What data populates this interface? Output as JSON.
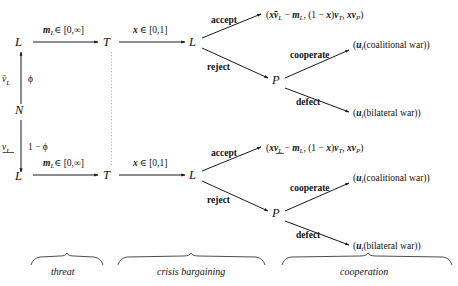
{
  "figure": {
    "background_color": "#ffffff",
    "line_color": "#1a1a1a",
    "infoset_color": "#9a9a9a"
  },
  "nodes": {
    "nature": "N",
    "top_leader": "L",
    "top_target": "T",
    "top_leader2": "L",
    "top_patron": "P",
    "bottom_leader": "L",
    "bottom_target": "T",
    "bottom_leader2": "L",
    "bottom_patron": "P"
  },
  "nature_branches": {
    "top_type": "v̄",
    "top_type_sub": "L",
    "top_prob": "ϕ",
    "bottom_type": "v",
    "bottom_type_sub": "L",
    "bottom_prob": "1 − ϕ"
  },
  "edges": {
    "threat_action": "m",
    "threat_action_sub": "L",
    "threat_action_set": "∈ [0,∞]",
    "offer_action": "x",
    "offer_action_set": "∈ [0,1]",
    "accept": "accept",
    "reject": "reject",
    "cooperate": "cooperate",
    "defect": "defect"
  },
  "payoffs": {
    "top_accept": "(xv̄L − mL, (1 − x)vT, xvP)",
    "top_coalitional": "(ui(coalitional war))",
    "top_bilateral": "(ui(bilateral war))",
    "bottom_accept": "(xvL − mL, (1 − x)vT, xvP)",
    "bottom_coalitional": "(ui(coalitional war))",
    "bottom_bilateral": "(ui(bilateral war))"
  },
  "phases": [
    {
      "id": "threat",
      "label": "threat"
    },
    {
      "id": "crisis-bargaining",
      "label": "crisis bargaining"
    },
    {
      "id": "cooperation",
      "label": "cooperation"
    }
  ]
}
